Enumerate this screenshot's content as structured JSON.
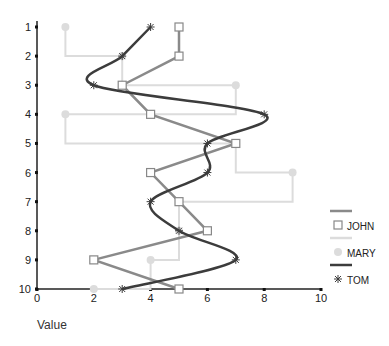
{
  "chart_data": {
    "type": "line",
    "orientation": "horizontal",
    "title": "",
    "xlabel": "Value",
    "ylabel": "",
    "xlim": [
      0,
      10
    ],
    "x_ticks": [
      "0",
      "2",
      "4",
      "6",
      "8",
      "10"
    ],
    "categories": [
      "1",
      "2",
      "3",
      "4",
      "5",
      "6",
      "7",
      "8",
      "9",
      "10"
    ],
    "grid": false,
    "legend_position": "right",
    "series": [
      {
        "name": "JOHN",
        "values": [
          5,
          5,
          3,
          4,
          7,
          4,
          5,
          6,
          2,
          5
        ],
        "style": "straight",
        "marker": "square",
        "color": "#8a8a8a"
      },
      {
        "name": "MARY",
        "values": [
          1,
          3,
          7,
          1,
          7,
          9,
          5,
          5,
          4,
          2
        ],
        "style": "step",
        "marker": "circle",
        "color": "#dcdcdc"
      },
      {
        "name": "TOM",
        "values": [
          4,
          3,
          2,
          8,
          6,
          6,
          4,
          5,
          7,
          3
        ],
        "style": "spline",
        "marker": "star",
        "color": "#3c3c3c"
      }
    ]
  },
  "legend": {
    "items": [
      {
        "label": "JOHN",
        "icon": "square-icon"
      },
      {
        "label": "MARY",
        "icon": "circle-icon"
      },
      {
        "label": "TOM",
        "icon": "star-icon"
      }
    ]
  }
}
